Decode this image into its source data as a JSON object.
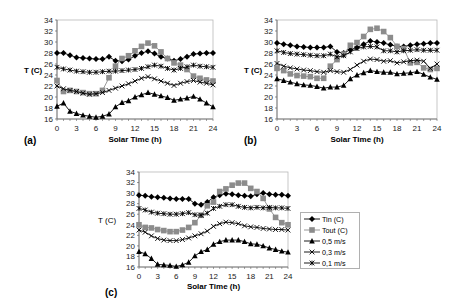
{
  "figure": {
    "legend": {
      "entries": [
        {
          "label": "Tin (C)",
          "marker": "diamond",
          "color": "#000000"
        },
        {
          "label": "Tout (C)",
          "marker": "square",
          "color": "#8c8c8c"
        },
        {
          "label": "0,5 m/s",
          "marker": "triangle",
          "color": "#000000"
        },
        {
          "label": "0,3 m/s",
          "marker": "x",
          "color": "#000000"
        },
        {
          "label": "0,1 m/s",
          "marker": "star",
          "color": "#000000"
        }
      ]
    },
    "panels": [
      {
        "id": "a",
        "panel_label": "(a)",
        "ylabel": "T (C)",
        "xlabel": "Solar Time (h)"
      },
      {
        "id": "b",
        "panel_label": "(b)",
        "ylabel": "T (C)",
        "xlabel": "Solar Time (h)"
      },
      {
        "id": "c",
        "panel_label": "(c)",
        "ylabel": "T (C)",
        "xlabel": "Solar Time (h)"
      }
    ],
    "x_ticks": [
      "0",
      "3",
      "6",
      "9",
      "12",
      "15",
      "18",
      "21",
      "24"
    ],
    "y_ticks": [
      "16",
      "18",
      "20",
      "22",
      "24",
      "26",
      "28",
      "30",
      "32",
      "34"
    ]
  },
  "chart_data": [
    {
      "type": "line",
      "title": "(a)",
      "xlabel": "Solar Time (h)",
      "ylabel": "T (C)",
      "xlim": [
        0,
        24
      ],
      "ylim": [
        16,
        34
      ],
      "grid": false,
      "legend_position": "shared, right of panel (c)",
      "x": [
        0,
        1,
        2,
        3,
        4,
        5,
        6,
        7,
        8,
        9,
        10,
        11,
        12,
        13,
        14,
        15,
        16,
        17,
        18,
        19,
        20,
        21,
        22,
        23,
        24
      ],
      "series": [
        {
          "name": "Tin (C)",
          "values": [
            28,
            28,
            27.6,
            27.2,
            27.1,
            27,
            26.9,
            26.9,
            27.3,
            26.6,
            26.5,
            26.8,
            27.5,
            28,
            28.3,
            27.9,
            27.3,
            27,
            26.6,
            26.9,
            27.3,
            27.8,
            27.9,
            28,
            28
          ]
        },
        {
          "name": "Tout (C)",
          "values": [
            23,
            21,
            21.2,
            21,
            20.8,
            20.6,
            20.6,
            21.2,
            23.5,
            25.6,
            27,
            27.5,
            28.4,
            29.2,
            29.8,
            29.3,
            28.2,
            27,
            26.2,
            25.8,
            25,
            23.8,
            23.4,
            23.1,
            22.9
          ]
        },
        {
          "name": "0,5 m/s",
          "values": [
            18.3,
            18.9,
            17.4,
            17,
            16.7,
            16.5,
            16.3,
            16.5,
            16.9,
            18.2,
            19,
            19.3,
            20,
            20.4,
            20.8,
            20.5,
            20.2,
            19.9,
            19.4,
            19.6,
            19.8,
            20.1,
            19.6,
            18.9,
            18.2
          ]
        },
        {
          "name": "0,3 m/s",
          "values": [
            22,
            21.5,
            21.2,
            21,
            20.7,
            20.5,
            20.6,
            20.8,
            21.2,
            21.6,
            22,
            22.4,
            22.9,
            23.4,
            23.7,
            23.3,
            22.9,
            22.5,
            22.1,
            22.5,
            22.8,
            23,
            22.7,
            22.5,
            22.2
          ]
        },
        {
          "name": "0,1 m/s",
          "values": [
            25.4,
            25.1,
            24.9,
            24.7,
            24.6,
            24.5,
            24.5,
            24.6,
            24.7,
            24.7,
            24.8,
            24.9,
            25,
            25.2,
            25.5,
            25.8,
            25.6,
            25.2,
            24.9,
            25.2,
            25.5,
            25.8,
            25.6,
            25.5,
            25.4
          ]
        }
      ]
    },
    {
      "type": "line",
      "title": "(b)",
      "xlabel": "Solar Time (h)",
      "ylabel": "T (C)",
      "xlim": [
        0,
        24
      ],
      "ylim": [
        16,
        34
      ],
      "grid": false,
      "x": [
        0,
        1,
        2,
        3,
        4,
        5,
        6,
        7,
        8,
        9,
        10,
        11,
        12,
        13,
        14,
        15,
        16,
        17,
        18,
        19,
        20,
        21,
        22,
        23,
        24
      ],
      "series": [
        {
          "name": "Tin (C)",
          "values": [
            29.8,
            29.6,
            29.4,
            29.2,
            29.1,
            29,
            29,
            29,
            29.2,
            28.2,
            28,
            28.6,
            29,
            29.6,
            30.2,
            30,
            29.8,
            29.5,
            29.2,
            29.2,
            29.4,
            29.6,
            29.7,
            29.8,
            29.8
          ]
        },
        {
          "name": "Tout (C)",
          "values": [
            25.2,
            24.8,
            24.2,
            23.9,
            23.8,
            23.7,
            23.4,
            23.4,
            25.6,
            26.8,
            27.8,
            29.4,
            29.9,
            31,
            32.3,
            32.5,
            31.9,
            30.8,
            29.2,
            28.8,
            26.2,
            26.3,
            25.3,
            25,
            25.2
          ]
        },
        {
          "name": "0,5 m/s",
          "values": [
            23.3,
            23,
            22.7,
            22.4,
            22.2,
            22.1,
            21.9,
            21.6,
            21.8,
            21.8,
            22.1,
            23.3,
            24,
            24.4,
            24.8,
            24.6,
            24.5,
            24.5,
            24.2,
            24.3,
            24.4,
            24.6,
            24.1,
            23.6,
            23.2
          ]
        },
        {
          "name": "0,3 m/s",
          "values": [
            26.1,
            25.6,
            25.3,
            25.1,
            24.9,
            24.8,
            24.6,
            24.5,
            24.8,
            24.6,
            24.5,
            25,
            25.8,
            26.5,
            26.9,
            26.8,
            26.5,
            26.6,
            26.2,
            26.4,
            26.6,
            26.7,
            26.5,
            25.2,
            26
          ]
        },
        {
          "name": "0,1 m/s",
          "values": [
            28.4,
            28.1,
            27.9,
            27.8,
            27.7,
            27.6,
            27.5,
            27.5,
            27.8,
            27.3,
            27.5,
            28.2,
            28.8,
            29.1,
            29.2,
            29.1,
            28.4,
            28.4,
            28.2,
            28.4,
            28.5,
            28.6,
            28.5,
            28.5,
            28.5
          ]
        }
      ]
    },
    {
      "type": "line",
      "title": "(c)",
      "xlabel": "Solar Time (h)",
      "ylabel": "T (C)",
      "xlim": [
        0,
        24
      ],
      "ylim": [
        16,
        34
      ],
      "grid": false,
      "x": [
        0,
        1,
        2,
        3,
        4,
        5,
        6,
        7,
        8,
        9,
        10,
        11,
        12,
        13,
        14,
        15,
        16,
        17,
        18,
        19,
        20,
        21,
        22,
        23,
        24
      ],
      "series": [
        {
          "name": "Tin (C)",
          "values": [
            29.6,
            29.5,
            29.3,
            29.2,
            29.1,
            29,
            28.9,
            28.9,
            28.9,
            28,
            27.8,
            28.3,
            29.2,
            29.6,
            29.9,
            29.8,
            29.6,
            29.5,
            29.4,
            29.8,
            30,
            29.8,
            29.7,
            29.7,
            29.5
          ]
        },
        {
          "name": "Tout (C)",
          "values": [
            24,
            23.5,
            23.4,
            23.1,
            22.9,
            22.7,
            22.7,
            23,
            23.5,
            24.4,
            25.8,
            27.6,
            28.3,
            30.3,
            30.8,
            31.5,
            31.9,
            31.9,
            30.9,
            30.3,
            29,
            27,
            25.4,
            24.4,
            24
          ]
        },
        {
          "name": "0,5 m/s",
          "values": [
            18.9,
            18.5,
            17.6,
            16.5,
            16.4,
            16.3,
            16.1,
            16.4,
            16.9,
            18.1,
            18.9,
            19.3,
            20.3,
            20.8,
            21.1,
            21.1,
            21.1,
            20.8,
            20.4,
            20.3,
            20,
            19.6,
            19.3,
            19,
            18.8
          ]
        },
        {
          "name": "0,3 m/s",
          "values": [
            23,
            22.6,
            21.9,
            21.4,
            21.1,
            21,
            21,
            21.2,
            21.5,
            21.9,
            22.3,
            22.8,
            23.7,
            24.2,
            24.5,
            24.4,
            24.2,
            23.8,
            23.6,
            23.5,
            23.3,
            23.2,
            23.1,
            23.1,
            23
          ]
        },
        {
          "name": "0,1 m/s",
          "values": [
            27.1,
            26.8,
            26.4,
            26.2,
            26.1,
            26,
            26,
            26.1,
            26.3,
            25.9,
            25.8,
            26.2,
            27.1,
            27.5,
            27.8,
            27.8,
            27.5,
            27.3,
            27.2,
            27.3,
            27.2,
            27.3,
            27.2,
            27.2,
            27.1
          ]
        }
      ]
    }
  ]
}
